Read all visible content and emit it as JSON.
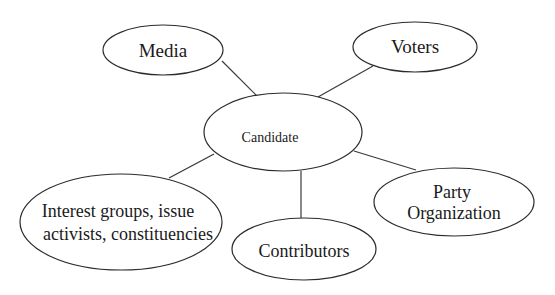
{
  "diagram": {
    "type": "hub-and-spoke",
    "center": {
      "id": "candidate",
      "label": "Candidate"
    },
    "nodes": [
      {
        "id": "media",
        "lines": [
          "Media"
        ]
      },
      {
        "id": "voters",
        "lines": [
          "Voters"
        ]
      },
      {
        "id": "interest",
        "lines": [
          "Interest groups, issue",
          "activists, constituencies"
        ]
      },
      {
        "id": "contributors",
        "lines": [
          "Contributors"
        ]
      },
      {
        "id": "party",
        "lines": [
          "Party",
          "Organization"
        ]
      }
    ],
    "edges": [
      {
        "from": "candidate",
        "to": "media"
      },
      {
        "from": "candidate",
        "to": "voters"
      },
      {
        "from": "candidate",
        "to": "interest"
      },
      {
        "from": "candidate",
        "to": "contributors"
      },
      {
        "from": "candidate",
        "to": "party"
      }
    ]
  }
}
